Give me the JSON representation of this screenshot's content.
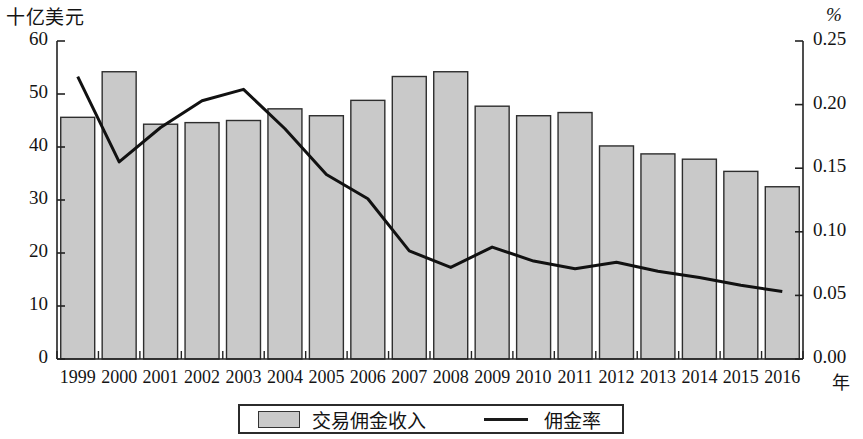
{
  "chart_data": {
    "type": "bar",
    "title": "",
    "xlabel": "年",
    "ylabel": "十亿美元",
    "y2label": "%",
    "categories": [
      "1999",
      "2000",
      "2001",
      "2002",
      "2003",
      "2004",
      "2005",
      "2006",
      "2007",
      "2008",
      "2009",
      "2010",
      "2011",
      "2012",
      "2013",
      "2014",
      "2015",
      "2016"
    ],
    "ylim": [
      0,
      60
    ],
    "y2lim": [
      0,
      0.25
    ],
    "yticks": [
      "0",
      "10",
      "20",
      "30",
      "40",
      "50",
      "60"
    ],
    "y2ticks": [
      "0.00",
      "0.05",
      "0.10",
      "0.15",
      "0.20",
      "0.25"
    ],
    "grid": false,
    "legend_position": "bottom",
    "series": [
      {
        "name": "交易佣金收入",
        "type": "bar",
        "axis": "left",
        "unit": "十亿美元",
        "values": [
          45.6,
          54.2,
          44.3,
          44.6,
          45.0,
          47.2,
          45.9,
          48.8,
          53.3,
          54.2,
          47.7,
          45.9,
          46.5,
          40.2,
          38.7,
          37.7,
          35.4,
          32.5
        ]
      },
      {
        "name": "佣金率",
        "type": "line",
        "axis": "right",
        "unit": "%",
        "values": [
          0.222,
          0.155,
          0.182,
          0.203,
          0.212,
          0.181,
          0.145,
          0.126,
          0.085,
          0.072,
          0.088,
          0.077,
          0.071,
          0.076,
          0.069,
          0.064,
          0.058,
          0.053
        ]
      }
    ]
  },
  "legend": {
    "bars_label": "交易佣金收入",
    "line_label": "佣金率"
  },
  "colors": {
    "bar_fill": "#c9c9c9",
    "bar_stroke": "#2e2e2e",
    "line": "#111111",
    "axis": "#222222"
  }
}
